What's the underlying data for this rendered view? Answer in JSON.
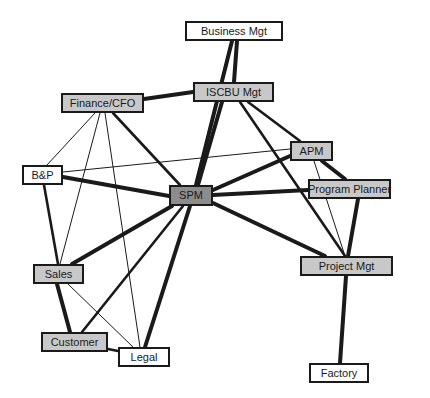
{
  "diagram": {
    "type": "stakeholder-network",
    "colors": {
      "white_fill": "#ffffff",
      "gray_fill": "#c8c8c8",
      "dark_fill": "#8c8c8c",
      "stroke": "#1a1a1a"
    },
    "nodes": [
      {
        "id": "business_mgt",
        "label": "Business Mgt",
        "x": 185,
        "y": 21,
        "w": 98,
        "h": 20,
        "fill": "white"
      },
      {
        "id": "iscbu_mgt",
        "label": "ISCBU Mgt",
        "x": 193,
        "y": 82,
        "w": 81,
        "h": 20,
        "fill": "gray"
      },
      {
        "id": "finance_cfo",
        "label": "Finance/CFO",
        "x": 61,
        "y": 93,
        "w": 83,
        "h": 20,
        "fill": "gray"
      },
      {
        "id": "apm",
        "label": "APM",
        "x": 290,
        "y": 141,
        "w": 43,
        "h": 20,
        "fill": "gray"
      },
      {
        "id": "bp",
        "label": "B&P",
        "x": 22,
        "y": 165,
        "w": 41,
        "h": 20,
        "fill": "white"
      },
      {
        "id": "spm",
        "label": "SPM",
        "x": 169,
        "y": 185,
        "w": 44,
        "h": 21,
        "fill": "dark"
      },
      {
        "id": "program_planner",
        "label": "Program Planner",
        "x": 308,
        "y": 179,
        "w": 83,
        "h": 20,
        "fill": "gray"
      },
      {
        "id": "project_mgt",
        "label": "Project Mgt",
        "x": 300,
        "y": 256,
        "w": 93,
        "h": 20,
        "fill": "gray"
      },
      {
        "id": "sales",
        "label": "Sales",
        "x": 33,
        "y": 264,
        "w": 51,
        "h": 20,
        "fill": "gray"
      },
      {
        "id": "customer",
        "label": "Customer",
        "x": 41,
        "y": 332,
        "w": 67,
        "h": 20,
        "fill": "gray"
      },
      {
        "id": "legal",
        "label": "Legal",
        "x": 118,
        "y": 347,
        "w": 52,
        "h": 20,
        "fill": "white"
      },
      {
        "id": "factory",
        "label": "Factory",
        "x": 309,
        "y": 363,
        "w": 60,
        "h": 20,
        "fill": "white"
      }
    ],
    "edges": [
      {
        "from": "business_mgt",
        "to": "iscbu_mgt",
        "weight": "thick",
        "x1": 237,
        "y1": 41,
        "x2": 234,
        "y2": 82
      },
      {
        "from": "business_mgt",
        "to": "spm",
        "weight": "thick",
        "x1": 232,
        "y1": 41,
        "x2": 196,
        "y2": 185
      },
      {
        "from": "iscbu_mgt",
        "to": "spm",
        "weight": "thick",
        "x1": 222,
        "y1": 102,
        "x2": 198,
        "y2": 185
      },
      {
        "from": "iscbu_mgt",
        "to": "finance_cfo",
        "weight": "thick",
        "x1": 193,
        "y1": 92,
        "x2": 144,
        "y2": 99
      },
      {
        "from": "iscbu_mgt",
        "to": "apm",
        "weight": "medium",
        "x1": 248,
        "y1": 102,
        "x2": 300,
        "y2": 141
      },
      {
        "from": "iscbu_mgt",
        "to": "project_mgt",
        "weight": "medium",
        "x1": 240,
        "y1": 102,
        "x2": 345,
        "y2": 256
      },
      {
        "from": "finance_cfo",
        "to": "spm",
        "weight": "medium",
        "x1": 113,
        "y1": 113,
        "x2": 180,
        "y2": 185
      },
      {
        "from": "finance_cfo",
        "to": "bp",
        "weight": "thin",
        "x1": 95,
        "y1": 113,
        "x2": 47,
        "y2": 165
      },
      {
        "from": "finance_cfo",
        "to": "sales",
        "weight": "thin",
        "x1": 100,
        "y1": 113,
        "x2": 60,
        "y2": 264
      },
      {
        "from": "finance_cfo",
        "to": "legal",
        "weight": "thin",
        "x1": 105,
        "y1": 113,
        "x2": 140,
        "y2": 347
      },
      {
        "from": "bp",
        "to": "spm",
        "weight": "thick",
        "x1": 63,
        "y1": 177,
        "x2": 169,
        "y2": 196
      },
      {
        "from": "bp",
        "to": "apm",
        "weight": "thin",
        "x1": 63,
        "y1": 172,
        "x2": 290,
        "y2": 149
      },
      {
        "from": "bp",
        "to": "sales",
        "weight": "medium",
        "x1": 44,
        "y1": 185,
        "x2": 58,
        "y2": 264
      },
      {
        "from": "spm",
        "to": "apm",
        "weight": "thick",
        "x1": 213,
        "y1": 190,
        "x2": 290,
        "y2": 156
      },
      {
        "from": "spm",
        "to": "program_planner",
        "weight": "thick",
        "x1": 213,
        "y1": 195,
        "x2": 308,
        "y2": 190
      },
      {
        "from": "spm",
        "to": "project_mgt",
        "weight": "thick",
        "x1": 213,
        "y1": 203,
        "x2": 325,
        "y2": 256
      },
      {
        "from": "spm",
        "to": "sales",
        "weight": "thick",
        "x1": 172,
        "y1": 206,
        "x2": 72,
        "y2": 264
      },
      {
        "from": "spm",
        "to": "customer",
        "weight": "medium",
        "x1": 183,
        "y1": 206,
        "x2": 82,
        "y2": 332
      },
      {
        "from": "spm",
        "to": "legal",
        "weight": "thick",
        "x1": 190,
        "y1": 206,
        "x2": 145,
        "y2": 347
      },
      {
        "from": "apm",
        "to": "program_planner",
        "weight": "thick",
        "x1": 322,
        "y1": 161,
        "x2": 345,
        "y2": 179
      },
      {
        "from": "apm",
        "to": "project_mgt",
        "weight": "thin",
        "x1": 314,
        "y1": 161,
        "x2": 345,
        "y2": 256
      },
      {
        "from": "program_planner",
        "to": "project_mgt",
        "weight": "thick",
        "x1": 358,
        "y1": 199,
        "x2": 348,
        "y2": 256
      },
      {
        "from": "project_mgt",
        "to": "factory",
        "weight": "thick",
        "x1": 346,
        "y1": 276,
        "x2": 340,
        "y2": 363
      },
      {
        "from": "sales",
        "to": "customer",
        "weight": "thick",
        "x1": 57,
        "y1": 284,
        "x2": 70,
        "y2": 332
      },
      {
        "from": "sales",
        "to": "legal",
        "weight": "thin",
        "x1": 68,
        "y1": 284,
        "x2": 133,
        "y2": 347
      },
      {
        "from": "customer",
        "to": "legal",
        "weight": "medium",
        "x1": 108,
        "y1": 349,
        "x2": 118,
        "y2": 351
      }
    ],
    "stroke_widths": {
      "thick": 4,
      "medium": 2.6,
      "thin": 1
    }
  }
}
